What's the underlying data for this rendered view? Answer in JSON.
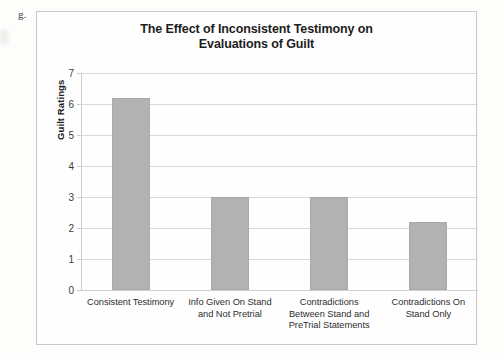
{
  "page": {
    "list_marker": "g."
  },
  "chart_data": {
    "type": "bar",
    "title": "The Effect of Inconsistent Testimony on Evaluations of Guilt",
    "title_line1": "The Effect of Inconsistent Testimony on",
    "title_line2": "Evaluations of Guilt",
    "xlabel": "",
    "ylabel": "Guilt Ratings",
    "ylim": [
      0,
      7
    ],
    "ytick_labels": [
      "7",
      "6",
      "5",
      "4",
      "3",
      "2",
      "1",
      "0"
    ],
    "yticks": [
      7,
      6,
      5,
      4,
      3,
      2,
      1,
      0
    ],
    "grid": true,
    "legend": false,
    "bar_color": "#b2b2b2",
    "categories": [
      "Consistent Testimony",
      "Info Given On Stand and Not Pretrial",
      "Contradictions Between Stand and PreTrial Statements",
      "Contradictions On Stand Only"
    ],
    "category_lines": [
      [
        "Consistent Testimony"
      ],
      [
        "Info Given On Stand",
        "and Not Pretrial"
      ],
      [
        "Contradictions",
        "Between Stand and",
        "PreTrial Statements"
      ],
      [
        "Contradictions On",
        "Stand Only"
      ]
    ],
    "values": [
      6.2,
      3.0,
      3.0,
      2.2
    ]
  }
}
